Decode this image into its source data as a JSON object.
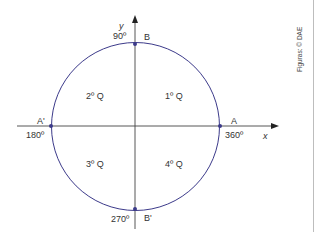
{
  "diagram": {
    "type": "trigonometric-circle",
    "colors": {
      "circle": "#3c3a8a",
      "axes": "#444444",
      "points": "#3c3a8a",
      "text": "#333333"
    },
    "axes": {
      "x_label": "x",
      "y_label": "y"
    },
    "points": {
      "A": {
        "label": "A",
        "angle": "360º"
      },
      "B": {
        "label": "B",
        "angle": "90º"
      },
      "A_prime": {
        "label": "A'",
        "angle": "180º"
      },
      "B_prime": {
        "label": "B'",
        "angle": "270º"
      }
    },
    "quadrants": [
      "1º Q",
      "2º Q",
      "3º Q",
      "4º Q"
    ],
    "credit": "Figuras: © DAE"
  }
}
